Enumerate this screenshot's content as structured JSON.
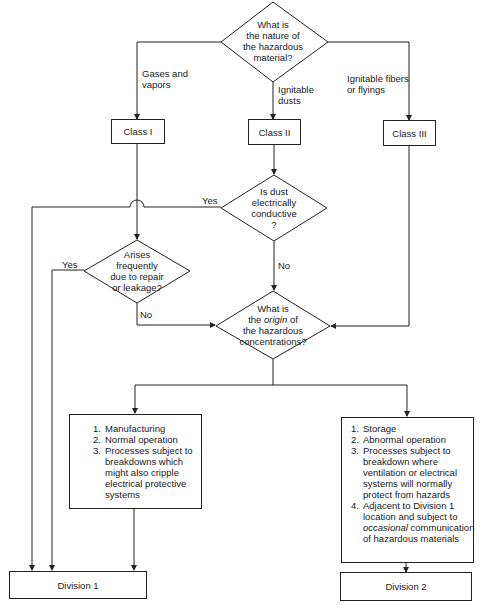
{
  "decisions": {
    "nature": {
      "lines": [
        "What is",
        "the nature of",
        "the hazardous",
        "material?"
      ]
    },
    "dust_conductive": {
      "lines": [
        "Is dust",
        "electrically",
        "conductive",
        "?"
      ]
    },
    "arises_frequently": {
      "lines": [
        "Arises",
        "frequently",
        "due to repair",
        "or leakage?"
      ]
    },
    "origin": {
      "line1": "What is",
      "line2_pre": "the ",
      "line2_em": "origin",
      "line2_post": " of",
      "line3": "the hazardous",
      "line4": "concentrations?"
    }
  },
  "branch_labels": {
    "gases": [
      "Gases and",
      "vapors"
    ],
    "dusts": [
      "Ignitable",
      "dusts"
    ],
    "fibers": [
      "Ignitable fibers",
      "or flyings"
    ],
    "dust_yes": "Yes",
    "dust_no": "No",
    "arises_yes": "Yes",
    "arises_no": "No"
  },
  "classes": {
    "class1": "Class I",
    "class2": "Class II",
    "class3": "Class III"
  },
  "division1_conditions": {
    "items": [
      {
        "num": "1.",
        "lines": [
          "Manufacturing"
        ]
      },
      {
        "num": "2.",
        "lines": [
          "Normal operation"
        ]
      },
      {
        "num": "3.",
        "lines": [
          "Processes subject to",
          "breakdowns which",
          "might also cripple",
          "electrical protective",
          "systems"
        ]
      }
    ]
  },
  "division2_conditions": {
    "items": [
      {
        "num": "1.",
        "lines": [
          "Storage"
        ]
      },
      {
        "num": "2.",
        "lines": [
          "Abnormal operation"
        ]
      },
      {
        "num": "3.",
        "lines": [
          "Processes subject to",
          "breakdown where",
          "ventilation or electrical",
          "systems will normally",
          "protect from hazards"
        ]
      },
      {
        "num": "4.",
        "l1": "Adjacent to Division 1",
        "l2": "location and subject to",
        "l3_em": "occasional",
        "l3_post": " communication",
        "l4": "of hazardous materials"
      }
    ]
  },
  "outcomes": {
    "division1": "Division 1",
    "division2": "Division 2"
  },
  "colors": {
    "line": "#222222",
    "background": "#ffffff",
    "text": "#1a1a1a"
  }
}
